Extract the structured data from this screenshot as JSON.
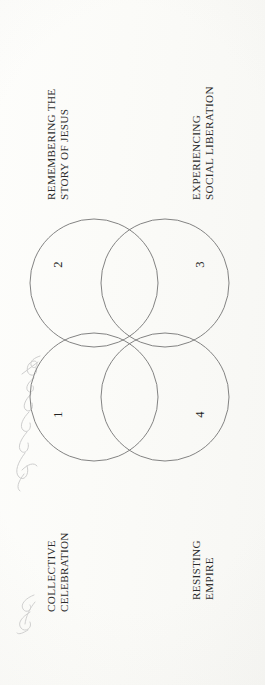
{
  "document": {
    "type": "scanned-book-page",
    "orientation": "rotated-90-ccw",
    "page_background": "#fcfcfa",
    "ink_color": "#2b2b2b",
    "stroke_color": "#6d6d6d"
  },
  "diagram": {
    "kind": "four-circle-venn",
    "circle_count": 4,
    "labels": [
      {
        "id": "remembering",
        "line1": "REMEMBERING THE",
        "line2": "STORY OF JESUS",
        "position": "top-left"
      },
      {
        "id": "experiencing",
        "line1": "EXPERIENCING",
        "line2": "SOCIAL LIBERATION",
        "position": "top-right"
      },
      {
        "id": "collective",
        "line1": "COLLECTIVE",
        "line2": "CELEBRATION",
        "position": "bottom-left"
      },
      {
        "id": "resisting",
        "line1": "RESISTING",
        "line2": "EMPIRE",
        "position": "bottom-right"
      }
    ],
    "region_numbers": [
      {
        "id": "region-1",
        "value": "1"
      },
      {
        "id": "region-2",
        "value": "2"
      },
      {
        "id": "region-3",
        "value": "3"
      },
      {
        "id": "region-4",
        "value": "4"
      }
    ]
  },
  "annotations": {
    "handwritten_margin_note": "",
    "handwritten_signature": ""
  }
}
